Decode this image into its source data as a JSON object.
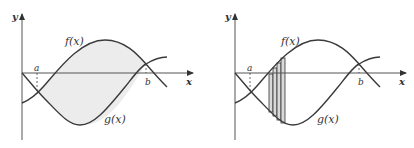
{
  "figures": [
    {
      "id": "left",
      "labels": {
        "y_axis": "y",
        "x_axis": "x",
        "f": "f(x)",
        "g": "g(x)",
        "a": "a",
        "b": "b"
      },
      "description": "Shaded region between f(x) and g(x) from a to b"
    },
    {
      "id": "right",
      "labels": {
        "y_axis": "y",
        "x_axis": "x",
        "f": "f(x)",
        "g": "g(x)",
        "a": "a",
        "b": "b"
      },
      "description": "Vertical rectangular strips approximating area between f(x) and g(x)",
      "strip_count": 4
    }
  ],
  "colors": {
    "curve": "#3a3a3a",
    "axis": "#555555",
    "shade": "#ececec",
    "strip_fill": "#d9d9d9"
  }
}
